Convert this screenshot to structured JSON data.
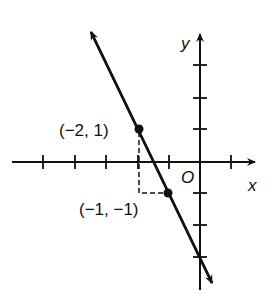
{
  "figure": {
    "axes": {
      "x_label": "x",
      "y_label": "y",
      "origin_label": "O"
    },
    "points": [
      {
        "label": "(−2, 1)",
        "x": -2,
        "y": 1
      },
      {
        "label": "(−1, −1)",
        "x": -1,
        "y": -1
      }
    ],
    "line": {
      "slope": -2,
      "y_intercept": -3,
      "passes_through": [
        "(-2, 1)",
        "(-1, -1)"
      ]
    },
    "x_ticks": [
      -5,
      -4,
      -3,
      -2,
      -1,
      1
    ],
    "y_ticks": [
      3,
      2,
      1,
      -1,
      -2,
      -3
    ]
  }
}
